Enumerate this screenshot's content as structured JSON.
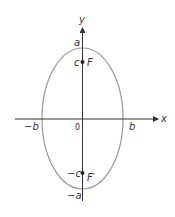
{
  "diagram": {
    "type": "ellipse-with-foci",
    "axes": {
      "x_label": "x",
      "y_label": "y",
      "origin_label": "0"
    },
    "vertices": {
      "top": "a",
      "bottom": "−a",
      "right": "b",
      "left": "−b"
    },
    "foci": {
      "upper": {
        "coord_label": "c",
        "name": "F"
      },
      "lower": {
        "coord_label": "−c",
        "name": "F′"
      }
    },
    "colors": {
      "ellipse": "#9a9a9a",
      "axes": "#333333",
      "text": "#333333"
    }
  }
}
